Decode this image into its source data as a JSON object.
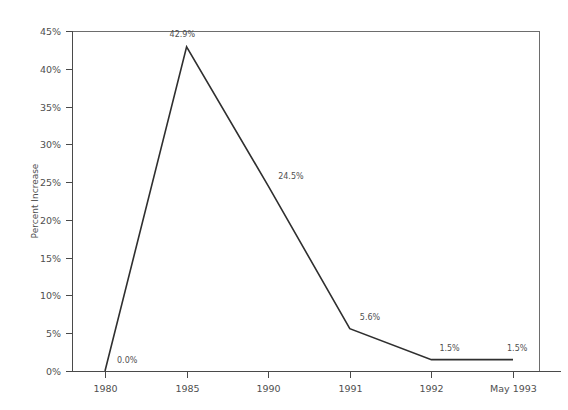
{
  "chart_data": {
    "type": "line",
    "title": "",
    "xlabel": "",
    "ylabel": "Percent Increase",
    "categories": [
      "1980",
      "1985",
      "1990",
      "1991",
      "1992",
      "May 1993"
    ],
    "values": [
      0.0,
      42.9,
      24.5,
      5.6,
      1.5,
      1.5
    ],
    "point_labels": [
      "0.0%",
      "42.9%",
      "24.5%",
      "5.6%",
      "1.5%",
      "1.5%"
    ],
    "ylim": [
      0,
      45
    ],
    "ytick_values": [
      0,
      5,
      10,
      15,
      20,
      25,
      30,
      35,
      40,
      45
    ],
    "ytick_labels": [
      "0%",
      "5%",
      "10%",
      "15%",
      "20%",
      "25%",
      "30%",
      "35%",
      "40%",
      "45%"
    ],
    "xtick_labels": [
      "1980",
      "1985",
      "1990",
      "1991",
      "1992",
      "May 1993"
    ],
    "grid": false,
    "legend": false,
    "legend_position": "none",
    "series": [
      {
        "name": "Percent Increase",
        "values": [
          0.0,
          42.9,
          24.5,
          5.6,
          1.5,
          1.5
        ]
      }
    ]
  },
  "style": {
    "background_color": "#ffffff",
    "line_color": "#2f2f2f",
    "axis_color": "#4a4a4a",
    "frame_color": "#6d6d6d",
    "text_color": "#4f4f4f"
  },
  "geometry": {
    "plot_left": 72,
    "plot_right": 539,
    "plot_top": 31,
    "plot_bottom": 371,
    "axis_extend_right": 560,
    "x_first_tick": 105,
    "x_tick_step": 81.6,
    "label_offsets": [
      {
        "dx": 12,
        "dy": -8
      },
      {
        "dx": -17,
        "dy": -10
      },
      {
        "dx": 10,
        "dy": -7
      },
      {
        "dx": 10,
        "dy": -9
      },
      {
        "dx": 8,
        "dy": -9
      },
      {
        "dx": -6,
        "dy": -9
      }
    ]
  }
}
